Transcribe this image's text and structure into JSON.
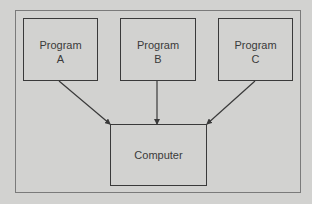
{
  "diagram": {
    "nodes": [
      {
        "id": "A",
        "line1": "Program",
        "line2": "A"
      },
      {
        "id": "B",
        "line1": "Program",
        "line2": "B"
      },
      {
        "id": "C",
        "line1": "Program",
        "line2": "C"
      },
      {
        "id": "computer",
        "label": "Computer"
      }
    ],
    "edges": [
      {
        "from": "A",
        "to": "computer"
      },
      {
        "from": "B",
        "to": "computer"
      },
      {
        "from": "C",
        "to": "computer"
      }
    ],
    "colors": {
      "background": "#d2d2d0",
      "stroke": "#3a3a3a"
    }
  }
}
